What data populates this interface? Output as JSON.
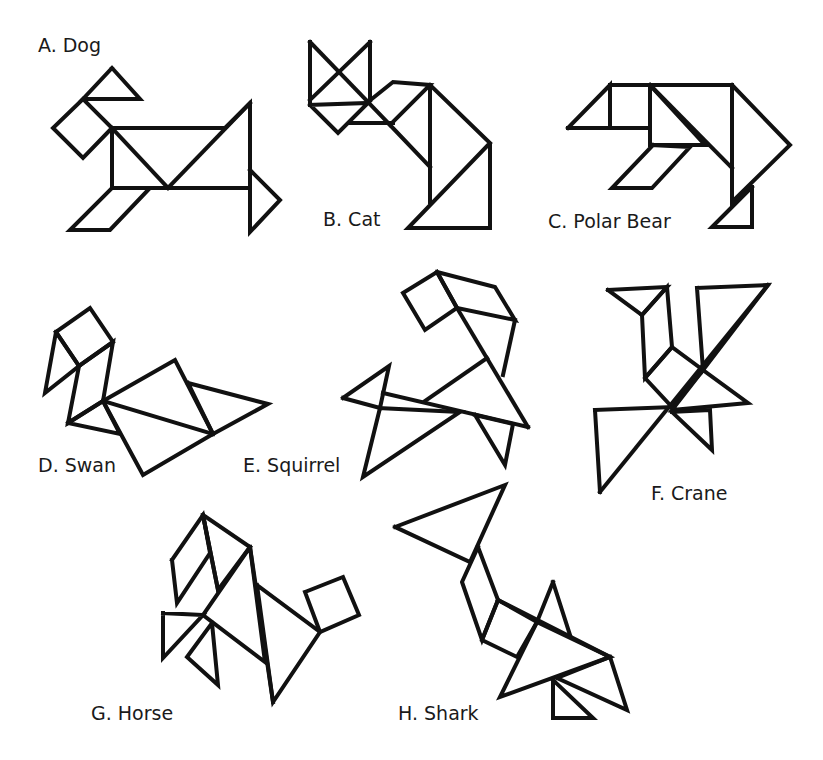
{
  "colors": {
    "stroke": "#111111",
    "background": "#ffffff",
    "text": "#1a1a1a"
  },
  "figures": [
    {
      "id": "dog",
      "label": "A. Dog",
      "label_pos": [
        38,
        52
      ],
      "polygons": [
        [
          [
            112,
            68
          ],
          [
            83,
            99
          ],
          [
            140,
            99
          ]
        ],
        [
          [
            83,
            99
          ],
          [
            53,
            128
          ],
          [
            83,
            158
          ],
          [
            112,
            128
          ]
        ],
        [
          [
            112,
            128
          ],
          [
            225,
            128
          ],
          [
            250,
            103
          ],
          [
            250,
            188
          ],
          [
            112,
            188
          ]
        ],
        [
          [
            112,
            128
          ],
          [
            168,
            188
          ]
        ],
        [
          [
            168,
            188
          ],
          [
            250,
            103
          ]
        ],
        [
          [
            112,
            188
          ],
          [
            150,
            188
          ],
          [
            110,
            230
          ],
          [
            70,
            230
          ]
        ],
        [
          [
            250,
            170
          ],
          [
            280,
            200
          ],
          [
            250,
            232
          ]
        ]
      ]
    },
    {
      "id": "cat",
      "label": "B. Cat",
      "label_pos": [
        323,
        226
      ],
      "polygons": [
        [
          [
            310,
            42
          ],
          [
            310,
            105
          ]
        ],
        [
          [
            310,
            42
          ],
          [
            368,
            102
          ]
        ],
        [
          [
            370,
            42
          ],
          [
            370,
            100
          ]
        ],
        [
          [
            370,
            42
          ],
          [
            310,
            100
          ]
        ],
        [
          [
            310,
            105
          ],
          [
            338,
            133
          ],
          [
            368,
            103
          ]
        ],
        [
          [
            350,
            123
          ],
          [
            393,
            123
          ]
        ],
        [
          [
            368,
            102
          ],
          [
            393,
            82
          ],
          [
            430,
            85
          ],
          [
            390,
            125
          ]
        ],
        [
          [
            390,
            125
          ],
          [
            430,
            167
          ]
        ],
        [
          [
            430,
            85
          ],
          [
            430,
            202
          ]
        ],
        [
          [
            430,
            85
          ],
          [
            490,
            143
          ],
          [
            490,
            228
          ],
          [
            408,
            228
          ],
          [
            490,
            143
          ]
        ]
      ]
    },
    {
      "id": "polar-bear",
      "label": "C. Polar Bear",
      "label_pos": [
        548,
        228
      ],
      "polygons": [
        [
          [
            568,
            128
          ],
          [
            610,
            85
          ],
          [
            610,
            128
          ]
        ],
        [
          [
            610,
            85
          ],
          [
            732,
            85
          ]
        ],
        [
          [
            610,
            128
          ],
          [
            650,
            128
          ]
        ],
        [
          [
            650,
            85
          ],
          [
            650,
            145
          ],
          [
            705,
            145
          ]
        ],
        [
          [
            650,
            85
          ],
          [
            732,
            168
          ]
        ],
        [
          [
            732,
            85
          ],
          [
            790,
            145
          ],
          [
            732,
            202
          ],
          [
            732,
            85
          ]
        ],
        [
          [
            653,
            145
          ],
          [
            690,
            147
          ],
          [
            652,
            188
          ],
          [
            612,
            188
          ],
          [
            653,
            145
          ]
        ],
        [
          [
            752,
            187
          ],
          [
            752,
            227
          ],
          [
            712,
            227
          ],
          [
            732,
            207
          ]
        ]
      ]
    },
    {
      "id": "swan",
      "label": "D. Swan",
      "label_pos": [
        38,
        472
      ],
      "polygons": [
        [
          [
            56,
            332
          ],
          [
            90,
            308
          ],
          [
            113,
            342
          ],
          [
            79,
            366
          ]
        ],
        [
          [
            56,
            332
          ],
          [
            45,
            393
          ],
          [
            79,
            366
          ]
        ],
        [
          [
            79,
            366
          ],
          [
            68,
            423
          ],
          [
            103,
            401
          ],
          [
            113,
            342
          ]
        ],
        [
          [
            68,
            423
          ],
          [
            120,
            434
          ],
          [
            103,
            401
          ]
        ],
        [
          [
            103,
            401
          ],
          [
            175,
            360
          ],
          [
            213,
            434
          ],
          [
            143,
            475
          ],
          [
            103,
            401
          ]
        ],
        [
          [
            103,
            401
          ],
          [
            213,
            434
          ]
        ],
        [
          [
            188,
            383
          ],
          [
            268,
            404
          ],
          [
            213,
            434
          ]
        ]
      ]
    },
    {
      "id": "squirrel",
      "label": "E. Squirrel",
      "label_pos": [
        243,
        472
      ],
      "polygons": [
        [
          [
            403,
            293
          ],
          [
            437,
            272
          ],
          [
            457,
            308
          ],
          [
            425,
            330
          ]
        ],
        [
          [
            437,
            272
          ],
          [
            495,
            287
          ],
          [
            515,
            320
          ],
          [
            457,
            308
          ]
        ],
        [
          [
            457,
            308
          ],
          [
            528,
            427
          ]
        ],
        [
          [
            515,
            320
          ],
          [
            503,
            375
          ]
        ],
        [
          [
            487,
            358
          ],
          [
            425,
            401
          ]
        ],
        [
          [
            383,
            393
          ],
          [
            528,
            427
          ]
        ],
        [
          [
            343,
            398
          ],
          [
            389,
            366
          ],
          [
            380,
            408
          ]
        ],
        [
          [
            380,
            408
          ],
          [
            363,
            477
          ],
          [
            460,
            412
          ]
        ],
        [
          [
            475,
            415
          ],
          [
            505,
            465
          ],
          [
            513,
            424
          ]
        ]
      ]
    },
    {
      "id": "crane",
      "label": "F. Crane",
      "label_pos": [
        651,
        500
      ],
      "polygons": [
        [
          [
            608,
            290
          ],
          [
            667,
            287
          ],
          [
            642,
            315
          ]
        ],
        [
          [
            642,
            315
          ],
          [
            645,
            378
          ],
          [
            672,
            347
          ],
          [
            667,
            287
          ]
        ],
        [
          [
            672,
            347
          ],
          [
            703,
            370
          ],
          [
            672,
            407
          ],
          [
            645,
            378
          ]
        ],
        [
          [
            697,
            288
          ],
          [
            768,
            285
          ],
          [
            703,
            370
          ]
        ],
        [
          [
            768,
            285
          ],
          [
            600,
            492
          ]
        ],
        [
          [
            703,
            370
          ],
          [
            748,
            403
          ],
          [
            672,
            410
          ]
        ],
        [
          [
            595,
            410
          ],
          [
            672,
            407
          ]
        ],
        [
          [
            595,
            410
          ],
          [
            600,
            492
          ]
        ],
        [
          [
            672,
            412
          ],
          [
            710,
            410
          ],
          [
            712,
            450
          ],
          [
            672,
            412
          ]
        ]
      ]
    },
    {
      "id": "horse",
      "label": "G. Horse",
      "label_pos": [
        91,
        720
      ],
      "polygons": [
        [
          [
            172,
            560
          ],
          [
            203,
            515
          ],
          [
            210,
            553
          ],
          [
            177,
            603
          ],
          [
            172,
            560
          ]
        ],
        [
          [
            203,
            515
          ],
          [
            250,
            547
          ],
          [
            218,
            590
          ]
        ],
        [
          [
            203,
            515
          ],
          [
            218,
            590
          ]
        ],
        [
          [
            250,
            547
          ],
          [
            203,
            615
          ],
          [
            265,
            662
          ]
        ],
        [
          [
            250,
            547
          ],
          [
            273,
            702
          ]
        ],
        [
          [
            257,
            585
          ],
          [
            320,
            632
          ],
          [
            273,
            702
          ]
        ],
        [
          [
            305,
            592
          ],
          [
            343,
            577
          ],
          [
            359,
            615
          ],
          [
            320,
            632
          ],
          [
            305,
            592
          ]
        ],
        [
          [
            163,
            613
          ],
          [
            203,
            615
          ],
          [
            163,
            658
          ],
          [
            163,
            613
          ]
        ],
        [
          [
            212,
            623
          ],
          [
            218,
            685
          ],
          [
            187,
            657
          ],
          [
            212,
            623
          ]
        ]
      ]
    },
    {
      "id": "shark",
      "label": "H. Shark",
      "label_pos": [
        398,
        720
      ],
      "polygons": [
        [
          [
            395,
            527
          ],
          [
            505,
            485
          ],
          [
            470,
            562
          ],
          [
            395,
            527
          ]
        ],
        [
          [
            478,
            547
          ],
          [
            498,
            600
          ],
          [
            482,
            640
          ],
          [
            462,
            582
          ],
          [
            478,
            547
          ]
        ],
        [
          [
            498,
            600
          ],
          [
            537,
            622
          ],
          [
            517,
            657
          ],
          [
            482,
            640
          ]
        ],
        [
          [
            553,
            582
          ],
          [
            570,
            635
          ]
        ],
        [
          [
            553,
            582
          ],
          [
            537,
            622
          ]
        ],
        [
          [
            498,
            600
          ],
          [
            610,
            657
          ]
        ],
        [
          [
            537,
            622
          ],
          [
            500,
            697
          ],
          [
            610,
            657
          ]
        ],
        [
          [
            557,
            678
          ],
          [
            627,
            710
          ],
          [
            610,
            657
          ]
        ],
        [
          [
            553,
            680
          ],
          [
            553,
            718
          ],
          [
            593,
            718
          ],
          [
            553,
            680
          ]
        ]
      ]
    }
  ]
}
